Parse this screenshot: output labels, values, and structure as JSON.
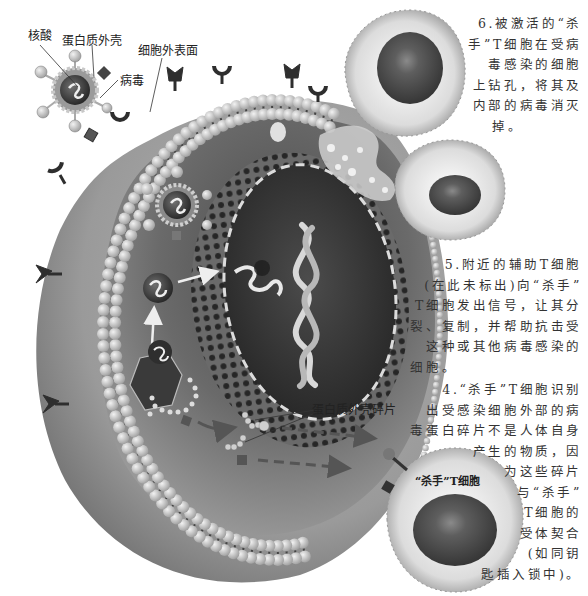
{
  "diagram": {
    "labels": {
      "nucleic_acid": "核酸",
      "protein_shell": "蛋白质外壳",
      "virus": "病毒",
      "cell_surface": "细胞外表面",
      "protein_shell_fragments": "蛋白质外壳碎片",
      "killer_t_cell": "“杀手”T细胞"
    },
    "annotations": {
      "step6": {
        "lines": [
          "6.被激活的“杀",
          "手”T细胞在受病",
          "毒感染的细胞",
          "上钻孔，将其及",
          "内部的病毒消灭",
          "掉。"
        ]
      },
      "step5": {
        "lines": [
          "5.附近的辅助T细胞",
          "(在此未标出)向“杀手”",
          "T细胞发出信号，让其分",
          "裂、复制，并帮助抗击受",
          "这种或其他病毒感染的",
          "细胞。"
        ]
      },
      "step4": {
        "lines": [
          "4.“杀手”T细胞识别",
          "出受感染细胞外部的病",
          "毒蛋白碎片不是人体自身",
          "产生的物质，因",
          "为这些碎片",
          "与“杀手”",
          "T细胞的",
          "受体契合",
          "(如同钥",
          "匙插入锁中)。"
        ]
      }
    },
    "colors": {
      "background": "#ffffff",
      "cytoplasm": "#8a8a8a",
      "cell_outer": "#9c9c9c",
      "membrane_bead": "#c8c8c8",
      "nucleus": "#3a3a3a",
      "nuclear_envelope": "#5a5a5a",
      "tcell_body": "#e6e6e6",
      "tcell_nucleus": "#555555",
      "text": "#333333"
    }
  }
}
